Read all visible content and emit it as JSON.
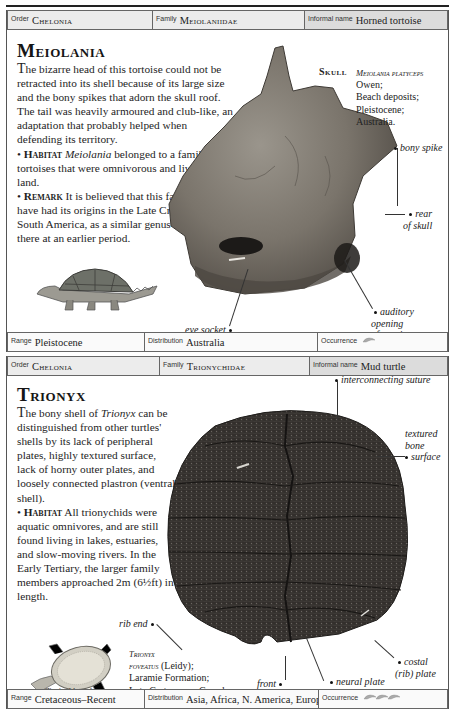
{
  "cards": [
    {
      "header": {
        "order_label": "Order",
        "order_value": "Chelonia",
        "family_label": "Family",
        "family_value": "Meiolaniidae",
        "informal_label": "Informal name",
        "informal_value": "Horned tortoise"
      },
      "title": "Meiolania",
      "description": {
        "intro_first": "T",
        "intro_rest": "he bizarre head of this tortoise could not be retracted into its shell because of its large size and the bony spikes that adorn the skull roof. The tail was heavily armoured and club-like, an adaptation that probably helped when defending its territory.",
        "habitat_label": "Habitat",
        "habitat_genus": "Meiolania",
        "habitat_text": "belonged to a family of tortoises that were omnivorous and lived on land.",
        "remark_label": "Remark",
        "remark_text": "It is believed that this family may have had its origins in the Late Cretaceous of South America, as a similar genus occurred there at an earlier period."
      },
      "specimen_label": "Skull",
      "scientific_name": {
        "species": "Meiolania platyceps",
        "author": "Owen;",
        "lines": [
          "Beach deposits;",
          "Pleistocene;",
          "Australia."
        ]
      },
      "annotations": {
        "bony_spike": "bony spike",
        "rear_of_skull_1": "rear",
        "rear_of_skull_2": "of skull",
        "auditory_1": "auditory opening",
        "auditory_2": "of cranium",
        "eye_socket": "eye socket"
      },
      "illustration_caption": "Typical length 2m (6½ft)",
      "footer": {
        "range_label": "Range",
        "range_value": "Pleistocene",
        "distribution_label": "Distribution",
        "distribution_value": "Australia",
        "occurrence_label": "Occurrence",
        "occurrence_icon": "fossil-shell-icon",
        "occurrence_count": 1
      }
    },
    {
      "header": {
        "order_label": "Order",
        "order_value": "Chelonia",
        "family_label": "Family",
        "family_value": "Trionychidae",
        "informal_label": "Informal name",
        "informal_value": "Mud turtle"
      },
      "title": "Trionyx",
      "description": {
        "intro_first": "T",
        "intro_pre": "he bony shell of ",
        "intro_genus": "Trionyx",
        "intro_rest": " can be distinguished from other turtles' shells by its lack of peripheral plates, highly textured surface, lack of horny outer plates, and loosely connected plastron (ventral shell).",
        "habitat_label": "Habitat",
        "habitat_text": "All trionychids were aquatic omnivores, and are still found living in lakes, estuaries, and slow-moving rivers. In the Early Tertiary, the larger family members approached 2m (6½ft) in length."
      },
      "scientific_name": {
        "species_1": "Trionyx",
        "species_2": "foveatus",
        "author": "(Leidy);",
        "lines": [
          "Laramie Formation;",
          "Late Cretaceous; Canada."
        ]
      },
      "annotations": {
        "interconnecting_suture": "interconnecting suture",
        "textured_1": "textured",
        "textured_2": "bone",
        "textured_3": "surface",
        "rib_end": "rib end",
        "costal_1": "costal",
        "costal_2": "(rib) plate",
        "neural_plate": "neural plate",
        "front": "front"
      },
      "illustration_caption_1": "Typical length",
      "illustration_caption_2": "90cm (36in)",
      "footer": {
        "range_label": "Range",
        "range_value": "Cretaceous–Recent",
        "distribution_label": "Distribution",
        "distribution_value": "Asia, Africa, N. America, Europe",
        "occurrence_label": "Occurrence",
        "occurrence_icon": "fossil-shell-icon",
        "occurrence_count": 3
      }
    }
  ],
  "colors": {
    "header_bg": "#ececec",
    "header_last_bg": "#dcdcdc",
    "border": "#666666",
    "text": "#1e1e1e",
    "skull_fossil": "#7a746b",
    "shell_fossil": "#2f2b29"
  }
}
